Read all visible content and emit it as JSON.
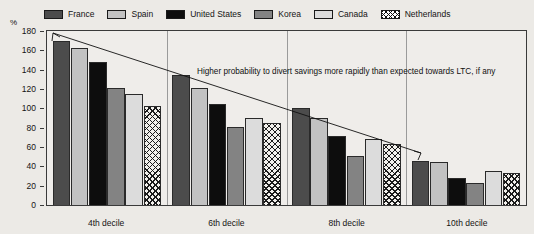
{
  "axis_unit": "%",
  "legend": {
    "items": [
      {
        "label": "France",
        "key": "france",
        "swatch": "dark-gray-swatch"
      },
      {
        "label": "Spain",
        "key": "spain",
        "swatch": "light-gray-swatch"
      },
      {
        "label": "United States",
        "key": "us",
        "swatch": "black-swatch"
      },
      {
        "label": "Korea",
        "key": "korea",
        "swatch": "mid-gray-swatch"
      },
      {
        "label": "Canada",
        "key": "canada",
        "swatch": "pale-gray-swatch"
      },
      {
        "label": "Netherlands",
        "key": "neth",
        "swatch": "crosshatch-swatch"
      }
    ]
  },
  "annotation": "Higher probability to divert savings more rapidly than expected towards LTC, if any",
  "chart_data": {
    "type": "bar",
    "title": "",
    "subtitle": "",
    "xlabel": "",
    "ylabel": "%",
    "ylim": [
      0,
      180
    ],
    "yticks": [
      0,
      20,
      40,
      60,
      80,
      100,
      120,
      140,
      160,
      180
    ],
    "ytick_labels": [
      "0",
      "20",
      "40",
      "60",
      "80",
      "100",
      "120",
      "140",
      "160",
      "180"
    ],
    "grid": false,
    "legend_position": "top",
    "categories": [
      "4th decile",
      "6th decile",
      "8th decile",
      "10th decile"
    ],
    "series": [
      {
        "name": "France",
        "values": [
          170,
          134,
          100,
          46
        ]
      },
      {
        "name": "Spain",
        "values": [
          162,
          121,
          90,
          44
        ]
      },
      {
        "name": "United States",
        "values": [
          148,
          105,
          71,
          28
        ]
      },
      {
        "name": "Korea",
        "values": [
          121,
          81,
          51,
          23
        ]
      },
      {
        "name": "Canada",
        "values": [
          115,
          90,
          68,
          35
        ]
      },
      {
        "name": "Netherlands",
        "values": [
          102,
          85,
          63,
          33
        ]
      }
    ],
    "annotations": [
      {
        "text": "Higher probability to divert savings more rapidly than expected towards LTC, if any",
        "type": "double-headed-arrow-with-label"
      }
    ]
  }
}
